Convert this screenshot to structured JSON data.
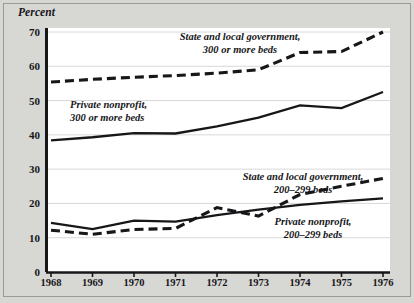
{
  "figure": {
    "y_axis_title": "Percent",
    "background_color": "#d7d7d4",
    "plot_background_color": "#ffffff",
    "line_color": "#17171a",
    "grid_color": "#d8d8d8"
  },
  "annotations": [
    {
      "id": "state-local-300",
      "line1": "State and local government,",
      "line2": "300 or more beds"
    },
    {
      "id": "private-nonprofit-300",
      "line1": "Private nonprofit,",
      "line2": "300 or more beds"
    },
    {
      "id": "state-local-200",
      "line1": "State and local government,",
      "line2": "200–299 beds"
    },
    {
      "id": "private-nonprofit-200",
      "line1": "Private nonprofit,",
      "line2": "200–299 beds"
    }
  ],
  "chart_data": {
    "type": "line",
    "title": "",
    "xlabel": "",
    "ylabel": "Percent",
    "xlim": [
      1968,
      1976
    ],
    "ylim": [
      0,
      70
    ],
    "yticks": [
      0,
      10,
      20,
      30,
      40,
      50,
      60,
      70
    ],
    "ytick_labels": [
      "0",
      "10",
      "20",
      "30",
      "40",
      "50",
      "60",
      "70"
    ],
    "x": [
      1968,
      1969,
      1970,
      1971,
      1972,
      1973,
      1974,
      1975,
      1976
    ],
    "xtick_labels": [
      "1968",
      "1969",
      "1970",
      "1971",
      "1972",
      "1973",
      "1974",
      "1975",
      "1976"
    ],
    "grid": "horizontal",
    "legend": "inline-annotations",
    "series": [
      {
        "name": "State and local government, 300 or more beds",
        "style": "dashed",
        "values": [
          55.4,
          56.2,
          56.8,
          57.3,
          58.0,
          59.0,
          64.0,
          64.3,
          70.0
        ]
      },
      {
        "name": "Private nonprofit, 300 or more beds",
        "style": "solid",
        "values": [
          38.4,
          39.3,
          40.5,
          40.4,
          42.5,
          45.0,
          48.6,
          47.8,
          52.5
        ]
      },
      {
        "name": "State and local government, 200–299 beds",
        "style": "dashed",
        "values": [
          12.2,
          11.0,
          12.4,
          12.7,
          18.8,
          16.3,
          22.6,
          25.0,
          27.3
        ]
      },
      {
        "name": "Private nonprofit, 200–299 beds",
        "style": "solid",
        "values": [
          14.3,
          12.5,
          15.0,
          14.7,
          16.6,
          18.2,
          19.6,
          20.6,
          21.5
        ]
      }
    ]
  }
}
